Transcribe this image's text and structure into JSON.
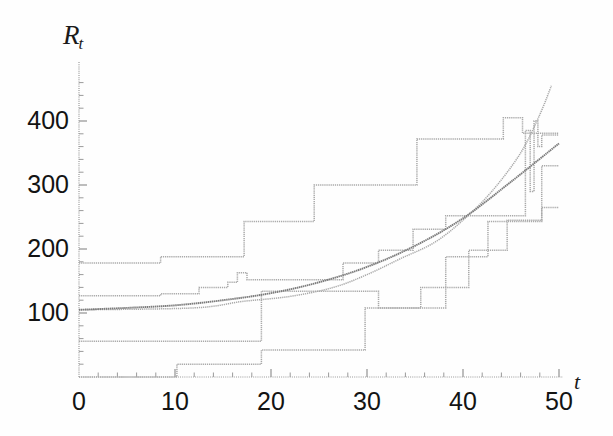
{
  "figure": {
    "width": 613,
    "height": 436,
    "background": "#fefefe",
    "axis_color": "#9a9a9a",
    "step_color": "#a9a9a9",
    "smooth_color": "#7c7c7c",
    "text_color": "#131313"
  },
  "axes": {
    "y_title_main": "R",
    "y_title_sub": "t",
    "x_title": "t",
    "y_ticks": [
      {
        "value": 100,
        "label": "100"
      },
      {
        "value": 200,
        "label": "200"
      },
      {
        "value": 300,
        "label": "300"
      },
      {
        "value": 400,
        "label": "400"
      }
    ],
    "x_ticks": [
      {
        "value": 0,
        "label": "0"
      },
      {
        "value": 10,
        "label": "10"
      },
      {
        "value": 20,
        "label": "20"
      },
      {
        "value": 30,
        "label": "30"
      },
      {
        "value": 40,
        "label": "40"
      },
      {
        "value": 50,
        "label": "50"
      }
    ]
  },
  "chart_data": {
    "type": "line",
    "title": "",
    "subtitle": "",
    "xlabel": "t",
    "ylabel": "Rt",
    "xlim": [
      0,
      50
    ],
    "ylim": [
      0,
      465
    ],
    "grid": false,
    "legend": "none",
    "annotations": [],
    "series": [
      {
        "name": "path-1",
        "style": "step",
        "color": "#a9a9a9",
        "x": [
          0,
          5.5,
          8.5,
          16.5,
          24.0,
          34.5,
          43.5,
          45.5,
          47.0,
          50.0
        ],
        "values": [
          178,
          178,
          188,
          188,
          243,
          243,
          300,
          300,
          381,
          381
        ],
        "points": [
          {
            "t": 0,
            "R": 178
          },
          {
            "t": 5.5,
            "R": 178
          },
          {
            "t": 8.5,
            "R": 188
          },
          {
            "t": 16.5,
            "R": 188
          },
          {
            "t": 17.2,
            "R": 243
          },
          {
            "t": 24.0,
            "R": 243
          },
          {
            "t": 24.5,
            "R": 300
          },
          {
            "t": 34.5,
            "R": 300
          },
          {
            "t": 35.2,
            "R": 372
          },
          {
            "t": 43.5,
            "R": 372
          },
          {
            "t": 44.2,
            "R": 405
          },
          {
            "t": 45.6,
            "R": 405
          },
          {
            "t": 46.2,
            "R": 381
          },
          {
            "t": 50,
            "R": 381
          }
        ]
      },
      {
        "name": "path-2",
        "style": "step",
        "color": "#a9a9a9",
        "x": [
          0,
          10,
          20,
          30,
          40,
          50
        ],
        "values": [
          127,
          133,
          154,
          210,
          272,
          385
        ],
        "points": [
          {
            "t": 0,
            "R": 127
          },
          {
            "t": 8.5,
            "R": 130
          },
          {
            "t": 12.5,
            "R": 140
          },
          {
            "t": 15.5,
            "R": 148
          },
          {
            "t": 16.5,
            "R": 163
          },
          {
            "t": 17.5,
            "R": 152
          },
          {
            "t": 26.5,
            "R": 152
          },
          {
            "t": 27.5,
            "R": 178
          },
          {
            "t": 30.5,
            "R": 178
          },
          {
            "t": 31.2,
            "R": 198
          },
          {
            "t": 34.0,
            "R": 198
          },
          {
            "t": 34.8,
            "R": 231
          },
          {
            "t": 37.5,
            "R": 231
          },
          {
            "t": 38.2,
            "R": 252
          },
          {
            "t": 45.5,
            "R": 252
          },
          {
            "t": 46.2,
            "R": 252
          },
          {
            "t": 46.5,
            "R": 385
          },
          {
            "t": 47.0,
            "R": 290
          },
          {
            "t": 47.4,
            "R": 400
          },
          {
            "t": 47.8,
            "R": 360
          },
          {
            "t": 48.2,
            "R": 378
          },
          {
            "t": 50,
            "R": 378
          }
        ]
      },
      {
        "name": "path-3",
        "style": "step",
        "color": "#a9a9a9",
        "x": [
          0,
          18,
          30,
          38,
          50
        ],
        "values": [
          56,
          56,
          134,
          215,
          265
        ],
        "points": [
          {
            "t": 0,
            "R": 56
          },
          {
            "t": 18.0,
            "R": 56
          },
          {
            "t": 19.0,
            "R": 134
          },
          {
            "t": 30.5,
            "R": 134
          },
          {
            "t": 31.2,
            "R": 108
          },
          {
            "t": 37.5,
            "R": 108
          },
          {
            "t": 38.2,
            "R": 188
          },
          {
            "t": 42.0,
            "R": 188
          },
          {
            "t": 42.6,
            "R": 243
          },
          {
            "t": 47.5,
            "R": 243
          },
          {
            "t": 48.2,
            "R": 265
          },
          {
            "t": 50,
            "R": 265
          }
        ]
      },
      {
        "name": "path-4",
        "style": "step",
        "color": "#a9a9a9",
        "x": [
          0,
          9,
          18,
          29,
          36,
          50
        ],
        "values": [
          0,
          0,
          20,
          42,
          108,
          250
        ],
        "points": [
          {
            "t": 0,
            "R": 0
          },
          {
            "t": 9.2,
            "R": 0
          },
          {
            "t": 10.2,
            "R": 20
          },
          {
            "t": 18.2,
            "R": 20
          },
          {
            "t": 19.0,
            "R": 42
          },
          {
            "t": 29.0,
            "R": 42
          },
          {
            "t": 29.8,
            "R": 108
          },
          {
            "t": 35.0,
            "R": 108
          },
          {
            "t": 35.6,
            "R": 140
          },
          {
            "t": 40.0,
            "R": 140
          },
          {
            "t": 40.6,
            "R": 198
          },
          {
            "t": 44.0,
            "R": 198
          },
          {
            "t": 44.6,
            "R": 245
          },
          {
            "t": 47.5,
            "R": 245
          },
          {
            "t": 48.2,
            "R": 330
          },
          {
            "t": 50,
            "R": 330
          }
        ]
      },
      {
        "name": "path-5",
        "style": "step",
        "color": "#a9a9a9",
        "x": [
          0,
          17,
          25,
          33,
          42,
          50
        ],
        "values": [
          105,
          118,
          160,
          215,
          290,
          415
        ],
        "points": [
          {
            "t": 0,
            "R": 105
          },
          {
            "t": 12.0,
            "R": 108
          },
          {
            "t": 17.0,
            "R": 118
          },
          {
            "t": 22.0,
            "R": 126
          },
          {
            "t": 26.5,
            "R": 140
          },
          {
            "t": 30.0,
            "R": 160
          },
          {
            "t": 33.5,
            "R": 185
          },
          {
            "t": 37.0,
            "R": 210
          },
          {
            "t": 40.0,
            "R": 245
          },
          {
            "t": 43.0,
            "R": 290
          },
          {
            "t": 46.0,
            "R": 350
          },
          {
            "t": 48.0,
            "R": 410
          },
          {
            "t": 49.2,
            "R": 455
          }
        ]
      },
      {
        "name": "mean-curve",
        "style": "smooth",
        "color": "#7c7c7c",
        "x": [
          0,
          5,
          10,
          15,
          20,
          25,
          30,
          35,
          40,
          45,
          50
        ],
        "values": [
          105,
          108,
          112,
          120,
          131,
          148,
          172,
          205,
          248,
          305,
          365
        ],
        "points": [
          {
            "t": 0,
            "R": 105
          },
          {
            "t": 5,
            "R": 108
          },
          {
            "t": 10,
            "R": 112
          },
          {
            "t": 15,
            "R": 120
          },
          {
            "t": 20,
            "R": 131
          },
          {
            "t": 25,
            "R": 148
          },
          {
            "t": 30,
            "R": 172
          },
          {
            "t": 35,
            "R": 205
          },
          {
            "t": 40,
            "R": 248
          },
          {
            "t": 45,
            "R": 305
          },
          {
            "t": 50,
            "R": 365
          }
        ]
      }
    ]
  }
}
